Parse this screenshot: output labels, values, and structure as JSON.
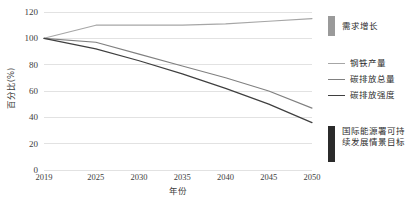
{
  "chart_data": {
    "type": "line",
    "title": "",
    "xlabel": "年份",
    "ylabel": "百分比(%)",
    "x": [
      2019,
      2025,
      2030,
      2035,
      2040,
      2045,
      2050
    ],
    "xlim": [
      2019,
      2050
    ],
    "ylim": [
      0,
      120
    ],
    "yticks": [
      0,
      20,
      40,
      60,
      80,
      100,
      120
    ],
    "xticks": [
      2019,
      2025,
      2030,
      2035,
      2040,
      2045,
      2050
    ],
    "grid": true,
    "legend_position": "right",
    "series": [
      {
        "name": "钢铁产量",
        "color": "#a6a6a6",
        "width": 1.1,
        "values": [
          100,
          110,
          110,
          110,
          111,
          113,
          115
        ]
      },
      {
        "name": "碳排放总量",
        "color": "#808080",
        "width": 1.1,
        "values": [
          100,
          97,
          88,
          79,
          70,
          60,
          47
        ]
      },
      {
        "name": "碳排放强度",
        "color": "#3f3f3f",
        "width": 1.2,
        "values": [
          100,
          92,
          83,
          73,
          62,
          50,
          36
        ]
      }
    ],
    "annotations": [
      {
        "id": "demand-growth",
        "label": "需求增长",
        "marker": "vertical-bar",
        "color": "#9a9a9a"
      },
      {
        "id": "iea-sds-target",
        "label": "国际能源署可持续发展情景目标",
        "marker": "vertical-bar",
        "color": "#2b2b2b"
      }
    ]
  },
  "axes": {
    "y_title": "百分比(%)",
    "x_title": "年份",
    "y_tick_labels": [
      "0",
      "20",
      "40",
      "60",
      "80",
      "100",
      "120"
    ],
    "x_tick_labels": [
      "2019",
      "2025",
      "2030",
      "2035",
      "2040",
      "2045",
      "2050"
    ]
  },
  "legend": {
    "top_annotation": "需求增长",
    "bottom_annotation": "国际能源署可持续发展情景目标",
    "series_labels": [
      "钢铁产量",
      "碳排放总量",
      "碳排放强度"
    ]
  },
  "colors": {
    "grid": "#e2e2e2",
    "text": "#404040",
    "series_1": "#a6a6a6",
    "series_2": "#808080",
    "series_3": "#3f3f3f",
    "annotation_light": "#9a9a9a",
    "annotation_dark": "#2b2b2b"
  }
}
